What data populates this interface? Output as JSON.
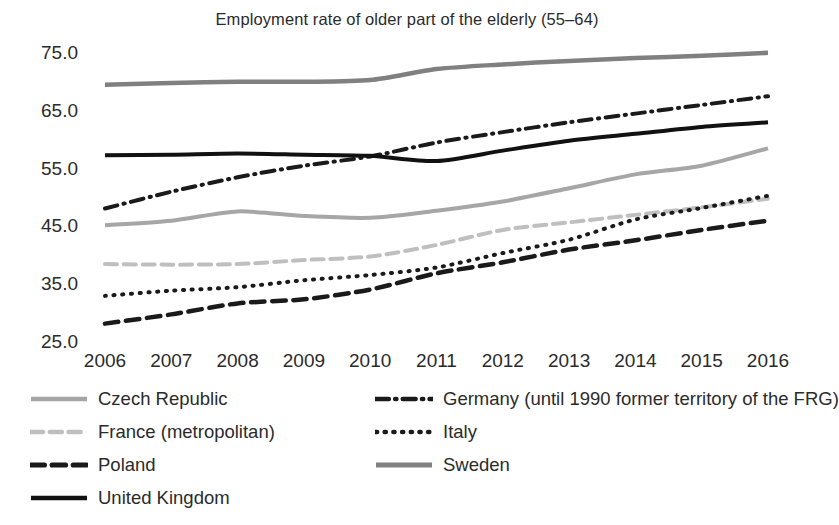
{
  "chart_data": {
    "type": "line",
    "title": "Employment rate of older part of the elderly (55–64)",
    "xlabel": "",
    "ylabel": "",
    "x": [
      2006,
      2007,
      2008,
      2009,
      2010,
      2011,
      2012,
      2013,
      2014,
      2015,
      2016
    ],
    "xtick_labels": [
      "2006",
      "2007",
      "2008",
      "2009",
      "2010",
      "2011",
      "2012",
      "2013",
      "2014",
      "2015",
      "2016"
    ],
    "ytick_labels": [
      "75.0",
      "65.0",
      "55.0",
      "45.0",
      "35.0",
      "25.0"
    ],
    "yticks": [
      75.0,
      65.0,
      55.0,
      45.0,
      35.0,
      25.0
    ],
    "ylim": [
      25.0,
      78.0
    ],
    "grid": false,
    "legend_position": "bottom",
    "series": [
      {
        "name": "Czech Republic",
        "style": "solid",
        "color": "#a6a6a6",
        "width": 4.0,
        "values": [
          45.2,
          46.0,
          47.6,
          46.8,
          46.5,
          47.7,
          49.3,
          51.6,
          54.0,
          55.5,
          58.5
        ]
      },
      {
        "name": "Germany (until 1990 former territory of the FRG)",
        "style": "dashdot",
        "color": "#1a1a1a",
        "width": 4.0,
        "values": [
          48.1,
          51.0,
          53.5,
          55.5,
          57.1,
          59.5,
          61.3,
          63.0,
          64.5,
          66.0,
          67.5
        ]
      },
      {
        "name": "France (metropolitan)",
        "style": "dashed",
        "color": "#bfbfbf",
        "width": 4.0,
        "values": [
          38.5,
          38.4,
          38.5,
          39.2,
          39.8,
          41.8,
          44.4,
          45.7,
          47.0,
          48.3,
          49.8
        ]
      },
      {
        "name": "Italy",
        "style": "dotted",
        "color": "#1a1a1a",
        "width": 4.0,
        "values": [
          33.0,
          33.9,
          34.5,
          35.7,
          36.6,
          37.9,
          40.4,
          42.7,
          46.2,
          48.2,
          50.3
        ]
      },
      {
        "name": "Poland",
        "style": "dashed",
        "color": "#1a1a1a",
        "width": 4.5,
        "values": [
          28.2,
          29.8,
          31.7,
          32.4,
          34.1,
          36.9,
          38.8,
          41.0,
          42.6,
          44.4,
          46.0
        ]
      },
      {
        "name": "Sweden",
        "style": "solid",
        "color": "#808080",
        "width": 4.5,
        "values": [
          69.5,
          69.8,
          70.0,
          70.0,
          70.3,
          72.2,
          73.0,
          73.6,
          74.1,
          74.5,
          75.0
        ]
      },
      {
        "name": "United Kingdom",
        "style": "solid",
        "color": "#111111",
        "width": 4.0,
        "values": [
          57.3,
          57.4,
          57.6,
          57.4,
          57.2,
          56.3,
          58.1,
          59.8,
          61.0,
          62.2,
          63.0
        ]
      }
    ]
  },
  "legend": {
    "items": [
      {
        "label": "Czech Republic",
        "series": "Czech Republic",
        "col": 0,
        "row": 0
      },
      {
        "label": "Germany (until 1990 former territory of the FRG)",
        "series": "Germany (until 1990 former territory of the FRG)",
        "col": 1,
        "row": 0
      },
      {
        "label": "France (metropolitan)",
        "series": "France (metropolitan)",
        "col": 0,
        "row": 1
      },
      {
        "label": "Italy",
        "series": "Italy",
        "col": 1,
        "row": 1
      },
      {
        "label": "Poland",
        "series": "Poland",
        "col": 0,
        "row": 2
      },
      {
        "label": "Sweden",
        "series": "Sweden",
        "col": 1,
        "row": 2
      },
      {
        "label": "United Kingdom",
        "series": "United Kingdom",
        "col": 0,
        "row": 3
      }
    ]
  },
  "plot_geometry": {
    "left": 105,
    "right": 768,
    "y_top_value": 78.0,
    "y_top_px": 35.5,
    "px_per_unit": 5.786
  }
}
